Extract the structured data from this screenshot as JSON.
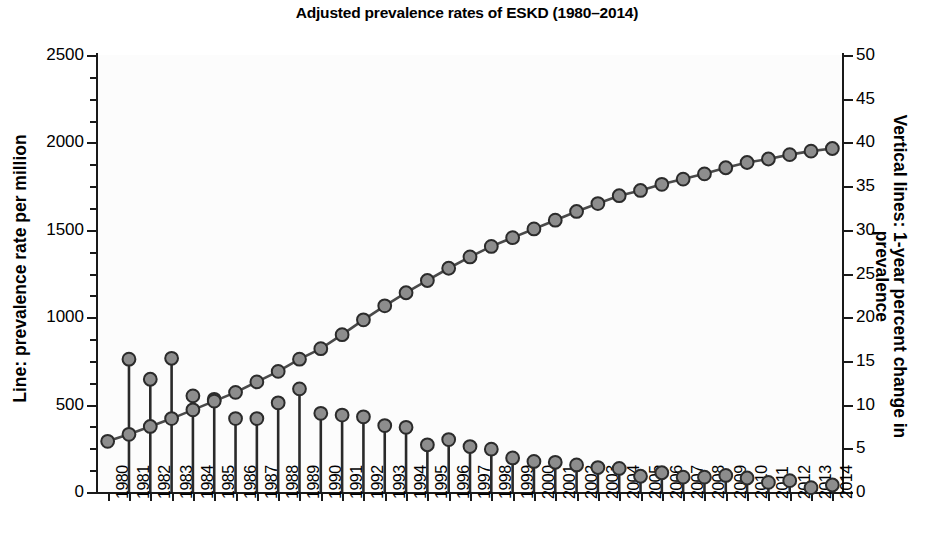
{
  "chart_data": {
    "type": "line",
    "title": "Adjusted prevalence rates of ESKD (1980–2014)",
    "xlabel": "",
    "ylabel": "Line: prevalence rate per million",
    "ylabel_right": "Vertical lines: 1-year percent change in prevalence",
    "ylim": [
      0,
      2500
    ],
    "ylim_right": [
      0,
      50
    ],
    "yticks": [
      0,
      500,
      1000,
      1500,
      2000,
      2500
    ],
    "yticks_right": [
      0,
      5,
      10,
      15,
      20,
      25,
      30,
      35,
      40,
      45,
      50
    ],
    "grid": false,
    "legend_position": "none",
    "categories": [
      "1980",
      "1981",
      "1982",
      "1983",
      "1984",
      "1985",
      "1986",
      "1987",
      "1988",
      "1989",
      "1990",
      "1991",
      "1992",
      "1993",
      "1994",
      "1995",
      "1996",
      "1997",
      "1998",
      "1999",
      "2000",
      "2001",
      "2002",
      "2003",
      "2004",
      "2005",
      "2006",
      "2007",
      "2008",
      "2009",
      "2010",
      "2011",
      "2012",
      "2013",
      "2014"
    ],
    "series": [
      {
        "name": "Line: prevalence rate per million",
        "axis": "left",
        "marker": "circle",
        "values": [
          290,
          330,
          375,
          420,
          470,
          520,
          570,
          630,
          690,
          760,
          820,
          900,
          985,
          1065,
          1140,
          1210,
          1280,
          1345,
          1405,
          1455,
          1505,
          1555,
          1605,
          1650,
          1695,
          1725,
          1760,
          1790,
          1820,
          1855,
          1885,
          1905,
          1930,
          1950,
          1965
        ]
      },
      {
        "name": "Vertical lines: 1-year percent change in prevalence",
        "axis": "right",
        "marker": "circle",
        "type": "stem",
        "values": [
          null,
          15.2,
          12.9,
          15.3,
          11.0,
          10.6,
          8.4,
          8.4,
          10.2,
          11.8,
          9.0,
          8.8,
          8.6,
          7.6,
          7.4,
          5.4,
          6.0,
          5.2,
          4.9,
          3.9,
          3.5,
          3.4,
          3.1,
          2.8,
          2.7,
          1.8,
          2.2,
          1.7,
          1.7,
          1.9,
          1.6,
          1.1,
          1.3,
          0.5,
          0.8
        ]
      }
    ]
  }
}
